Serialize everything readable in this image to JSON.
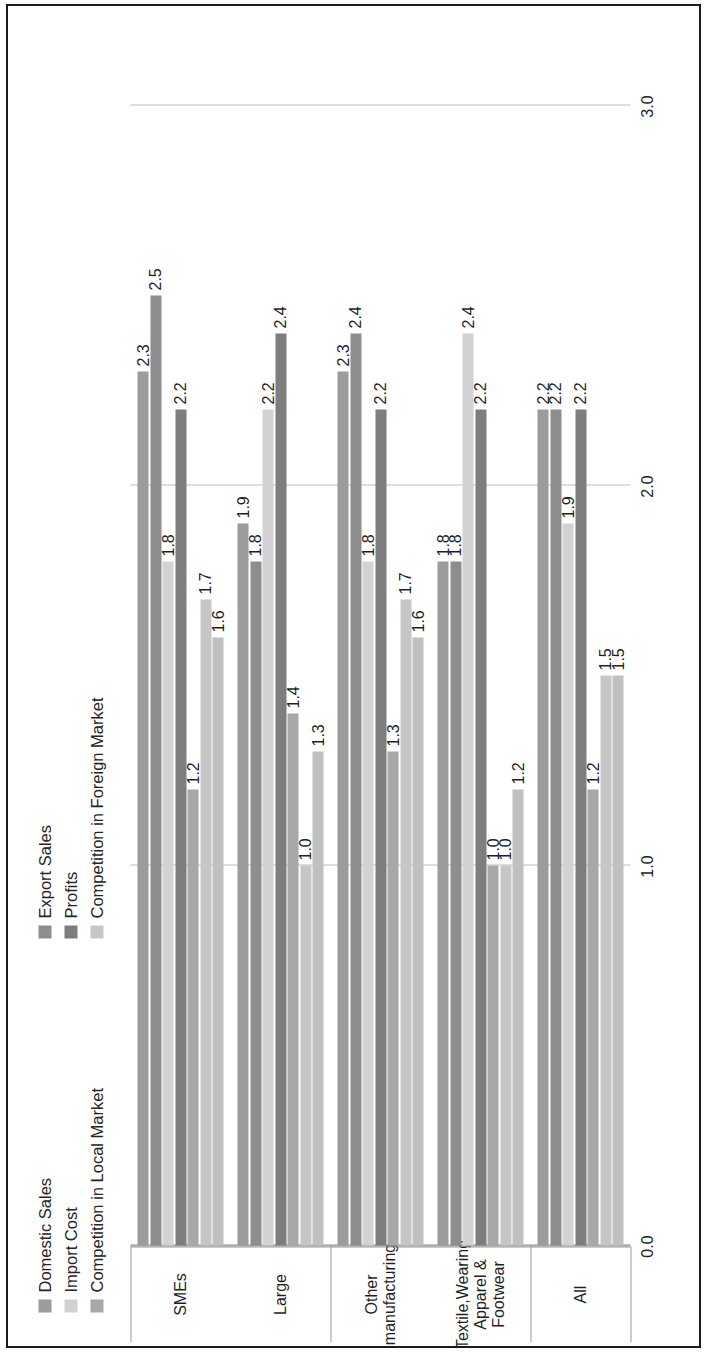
{
  "chart_data": {
    "type": "bar",
    "orientation": "horizontal",
    "title": "",
    "xlabel": "",
    "ylabel": "",
    "xlim": [
      0.0,
      3.0
    ],
    "grid": true,
    "tick_labels": [
      "0.0",
      "1.0",
      "2.0",
      "3.0"
    ],
    "tick_values": [
      0.0,
      1.0,
      2.0,
      3.0
    ],
    "legend_position": "top",
    "categories": [
      "SMEs",
      "Large",
      "Other manufacturing",
      "Textile,Wearing Apparel & Footwear",
      "All"
    ],
    "category_groups": [
      {
        "label": "Size",
        "categories": [
          "SMEs",
          "Large"
        ]
      },
      {
        "label": "Industry",
        "categories": [
          "Other manufacturing",
          "Textile,Wearing Apparel & Footwear"
        ]
      },
      {
        "label": "",
        "categories": [
          "All"
        ]
      }
    ],
    "series": [
      {
        "name": "Domestic Sales",
        "color": "#9c9c9c",
        "values": [
          2.3,
          1.9,
          2.3,
          1.8,
          2.2
        ]
      },
      {
        "name": "Export Sales",
        "color": "#8e8e8e",
        "values": [
          2.5,
          1.8,
          2.4,
          1.8,
          2.2
        ]
      },
      {
        "name": "Import Cost",
        "color": "#d2d2d2",
        "values": [
          1.8,
          2.2,
          1.8,
          2.4,
          1.9
        ]
      },
      {
        "name": "Profits",
        "color": "#7e7e7e",
        "values": [
          2.2,
          2.4,
          2.2,
          2.2,
          2.2
        ]
      },
      {
        "name": "Competition in Local Market",
        "color": "#a8a8a8",
        "values": [
          1.2,
          1.4,
          1.3,
          1.0,
          1.2
        ]
      },
      {
        "name": "Competition in Foreign Market",
        "color": "#c6c6c6",
        "values": [
          1.7,
          1.0,
          1.7,
          1.0,
          1.5
        ]
      },
      {
        "name": "Competition in Foreign Market 2",
        "color": "#c0c0c0",
        "values": [
          1.6,
          1.3,
          1.6,
          1.2,
          1.5
        ]
      }
    ],
    "data_labels": {
      "SMEs": [
        "2.3",
        "2.5",
        "1.8",
        "2.2",
        "1.2",
        "1.7",
        "1.6"
      ],
      "Large": [
        "1.9",
        "1.8",
        "2.2",
        "2.4",
        "1.4",
        "1.0",
        "1.3"
      ],
      "Other manufacturing": [
        "2.3",
        "2.4",
        "1.8",
        "2.2",
        "1.3",
        "1.7",
        "1.6"
      ],
      "Textile,Wearing Apparel & Footwear": [
        "1.8",
        "1.8",
        "2.4",
        "2.2",
        "1.0",
        "1.0",
        "1.2"
      ],
      "All": [
        "2.2",
        "2.2",
        "1.9",
        "2.2",
        "1.2",
        "1.5",
        "1.5"
      ]
    }
  },
  "legend": {
    "left_column": [
      {
        "label": "Domestic Sales",
        "color": "#9c9c9c"
      },
      {
        "label": "Import Cost",
        "color": "#d2d2d2"
      },
      {
        "label": "Competition in Local Market",
        "color": "#a8a8a8"
      }
    ],
    "right_column": [
      {
        "label": "Export Sales",
        "color": "#8e8e8e"
      },
      {
        "label": "Profits",
        "color": "#7e7e7e"
      },
      {
        "label": "Competition in Foreign Market",
        "color": "#c6c6c6"
      }
    ]
  },
  "axis": {
    "value_ticks": [
      "0.0",
      "1.0",
      "2.0",
      "3.0"
    ],
    "category_labels": [
      "SMEs",
      "Large",
      "Other manufacturing",
      "Textile,Wearing Apparel & Footwear",
      "All"
    ],
    "group_labels": [
      "Size",
      "Industry"
    ]
  }
}
